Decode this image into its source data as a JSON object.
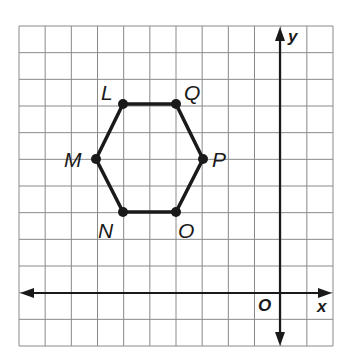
{
  "chart_data": {
    "type": "scatter",
    "title": "",
    "xlabel": "x",
    "ylabel": "y",
    "origin_label": "O",
    "grid": true,
    "xlim": [
      -10,
      2
    ],
    "ylim": [
      -2,
      10
    ],
    "shape": "hexagon",
    "vertices": [
      {
        "name": "L",
        "x": -6,
        "y": 7
      },
      {
        "name": "Q",
        "x": -4,
        "y": 7
      },
      {
        "name": "P",
        "x": -3,
        "y": 5
      },
      {
        "name": "O",
        "x": -4,
        "y": 3
      },
      {
        "name": "N",
        "x": -6,
        "y": 3
      },
      {
        "name": "M",
        "x": -7,
        "y": 5
      }
    ],
    "polygon_order": [
      "L",
      "Q",
      "P",
      "O",
      "N",
      "M"
    ]
  },
  "labels": {
    "L": "L",
    "Q": "Q",
    "P": "P",
    "O": "O",
    "N": "N",
    "M": "M",
    "x_axis": "x",
    "y_axis": "y",
    "origin": "O"
  },
  "colors": {
    "grid": "#8a8a8a",
    "axes": "#1a1a1a",
    "polygon": "#1a1a1a"
  }
}
